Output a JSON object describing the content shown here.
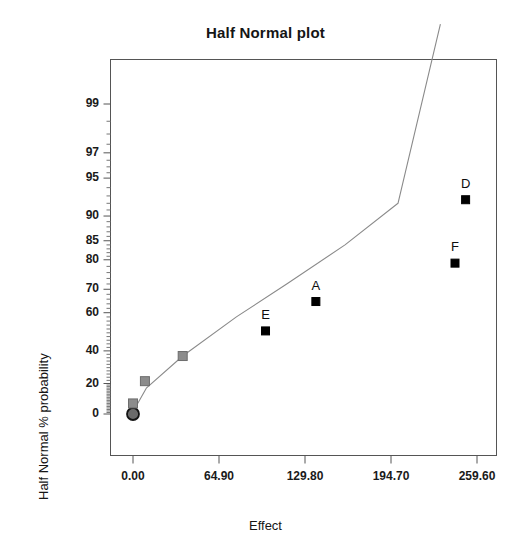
{
  "chart_data": {
    "type": "scatter",
    "title": "Half Normal plot",
    "xlabel": "Effect",
    "ylabel": "Half Normal % probability",
    "grid": false,
    "legend": "none",
    "xlim": [
      -20.0,
      285.0
    ],
    "ylim": [
      0,
      99.9
    ],
    "x_ticks": [
      {
        "label": "0.00",
        "value": 0.0
      },
      {
        "label": "64.90",
        "value": 64.9
      },
      {
        "label": "129.80",
        "value": 129.8
      },
      {
        "label": "194.70",
        "value": 194.7
      },
      {
        "label": "259.60",
        "value": 259.6
      }
    ],
    "y_ticks": [
      {
        "label": "0",
        "value": 0
      },
      {
        "label": "20",
        "value": 20
      },
      {
        "label": "40",
        "value": 40
      },
      {
        "label": "60",
        "value": 60
      },
      {
        "label": "70",
        "value": 70
      },
      {
        "label": "80",
        "value": 80
      },
      {
        "label": "85",
        "value": 85
      },
      {
        "label": "90",
        "value": 90
      },
      {
        "label": "95",
        "value": 95
      },
      {
        "label": "97",
        "value": 97
      },
      {
        "label": "99",
        "value": 99
      }
    ],
    "y_scale": "half-normal probability",
    "points": [
      {
        "label": "",
        "x": 0.0,
        "y": 0.0,
        "marker": "circle",
        "color": "#4d4d4d",
        "significant": false
      },
      {
        "label": "",
        "x": 0.0,
        "y": 7.0,
        "marker": "square",
        "color": "#8c8c8c",
        "significant": false
      },
      {
        "label": "",
        "x": 9.0,
        "y": 21.5,
        "marker": "square",
        "color": "#8c8c8c",
        "significant": false
      },
      {
        "label": "",
        "x": 37.5,
        "y": 37.0,
        "marker": "square",
        "color": "#8c8c8c",
        "significant": false
      },
      {
        "label": "E",
        "x": 100.0,
        "y": 51.0,
        "marker": "square",
        "color": "#000000",
        "significant": true
      },
      {
        "label": "A",
        "x": 138.0,
        "y": 65.0,
        "marker": "square",
        "color": "#000000",
        "significant": true
      },
      {
        "label": "F",
        "x": 243.0,
        "y": 79.0,
        "marker": "square",
        "color": "#000000",
        "significant": true
      },
      {
        "label": "D",
        "x": 251.0,
        "y": 92.5,
        "marker": "square",
        "color": "#000000",
        "significant": true
      }
    ],
    "reference_line": {
      "style": "solid",
      "color": "#8a8a8a",
      "description": "fitted half-normal reference line through the non-significant effects",
      "points": [
        {
          "x": 0.0,
          "y": 1.5
        },
        {
          "x": 10.0,
          "y": 17.0
        },
        {
          "x": 37.5,
          "y": 37.0
        },
        {
          "x": 78.0,
          "y": 58.0
        },
        {
          "x": 116.0,
          "y": 72.0
        },
        {
          "x": 160.0,
          "y": 84.0
        },
        {
          "x": 200.0,
          "y": 92.0
        },
        {
          "x": 232.0,
          "y": 99.9
        }
      ]
    }
  },
  "colors": {
    "axis": "#555555",
    "text": "#151515",
    "line": "#8a8a8a",
    "marker_significant": "#000000",
    "marker_other": "#8c8c8c",
    "background": "#ffffff"
  }
}
